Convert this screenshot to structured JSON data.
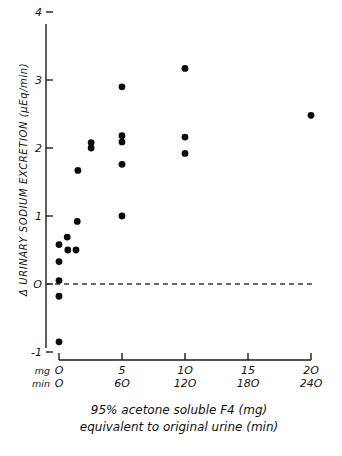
{
  "chart_data": {
    "type": "scatter",
    "title": "",
    "ylabel": "Δ URINARY SODIUM EXCRETION (µEq/min)",
    "xlabel_lines": [
      "95% acetone soluble F4 (mg)",
      "equivalent to original urine (min)"
    ],
    "ylim": [
      -1,
      4
    ],
    "xlim": [
      0,
      20
    ],
    "grid": false,
    "legend": null,
    "y_ticks": [
      {
        "value": 4,
        "label": "4"
      },
      {
        "value": 3,
        "label": "3"
      },
      {
        "value": 2,
        "label": "2"
      },
      {
        "value": 1,
        "label": "1"
      },
      {
        "value": 0,
        "label": "O"
      },
      {
        "value": -1,
        "label": "-1"
      }
    ],
    "x_axis_rows": [
      {
        "row_label": "mg",
        "ticks": [
          {
            "value": 0,
            "label": "O"
          },
          {
            "value": 5,
            "label": "5"
          },
          {
            "value": 10,
            "label": "1O"
          },
          {
            "value": 15,
            "label": "15"
          },
          {
            "value": 20,
            "label": "2O"
          }
        ]
      },
      {
        "row_label": "min",
        "ticks": [
          {
            "value": 0,
            "label": "O"
          },
          {
            "value": 5,
            "label": "6O"
          },
          {
            "value": 10,
            "label": "12O"
          },
          {
            "value": 15,
            "label": "18O"
          },
          {
            "value": 20,
            "label": "24O"
          }
        ]
      }
    ],
    "reference_line": {
      "y": 0,
      "style": "dashed",
      "label": ""
    },
    "points": [
      {
        "x": 0.0,
        "y": -0.85
      },
      {
        "x": 0.0,
        "y": -0.18
      },
      {
        "x": 0.0,
        "y": 0.05
      },
      {
        "x": 0.0,
        "y": 0.33
      },
      {
        "x": 0.0,
        "y": 0.58
      },
      {
        "x": 0.65,
        "y": 0.69
      },
      {
        "x": 0.7,
        "y": 0.5
      },
      {
        "x": 1.35,
        "y": 0.5
      },
      {
        "x": 1.45,
        "y": 0.92
      },
      {
        "x": 1.5,
        "y": 1.67
      },
      {
        "x": 2.55,
        "y": 2.08
      },
      {
        "x": 2.55,
        "y": 2.0
      },
      {
        "x": 5.0,
        "y": 2.9
      },
      {
        "x": 5.0,
        "y": 2.18
      },
      {
        "x": 5.0,
        "y": 2.09
      },
      {
        "x": 5.0,
        "y": 1.76
      },
      {
        "x": 5.0,
        "y": 1.0
      },
      {
        "x": 10.0,
        "y": 3.17
      },
      {
        "x": 10.0,
        "y": 2.16
      },
      {
        "x": 10.0,
        "y": 1.92
      },
      {
        "x": 20.0,
        "y": 2.48
      }
    ]
  }
}
